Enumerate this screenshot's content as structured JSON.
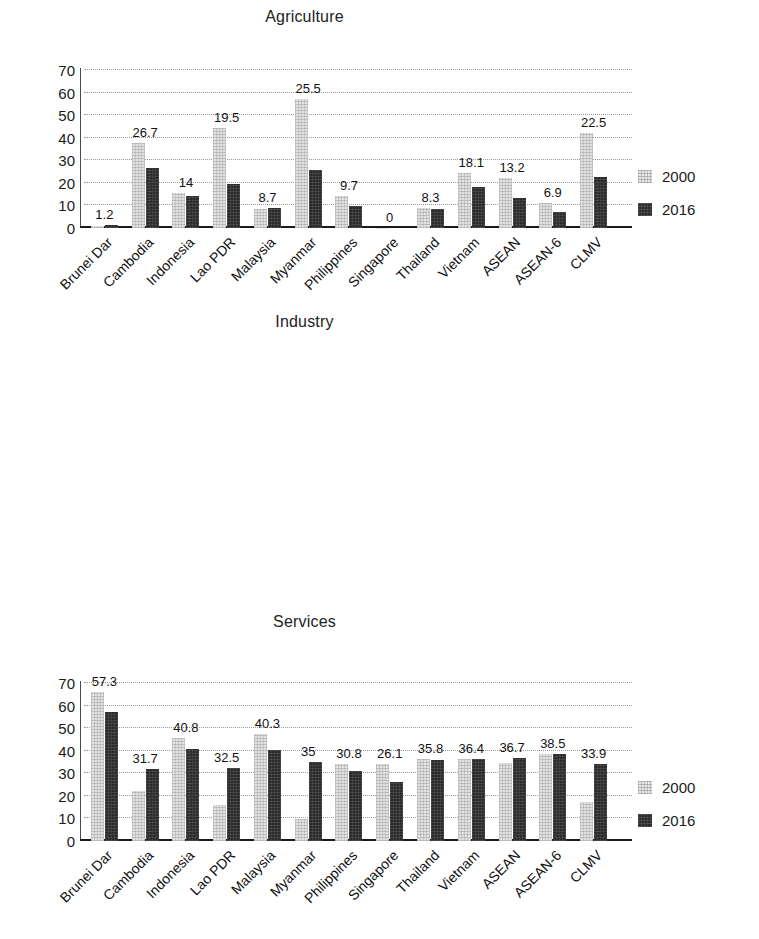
{
  "chart_data": [
    {
      "type": "bar",
      "title": "Agriculture",
      "xlabel": "",
      "ylabel": "",
      "ylim": [
        0,
        70
      ],
      "yticks": [
        0,
        10,
        20,
        30,
        40,
        50,
        60,
        70
      ],
      "grid": true,
      "legend_position": "right",
      "categories": [
        "Brunei Dar",
        "Cambodia",
        "Indonesia",
        "Lao PDR",
        "Malaysia",
        "Myanmar",
        "Philippines",
        "Singapore",
        "Thailand",
        "Vietnam",
        "ASEAN",
        "ASEAN-6",
        "CLMV"
      ],
      "series": [
        {
          "name": "2000",
          "values": [
            0.9,
            37.8,
            15.6,
            44.5,
            8.6,
            57.2,
            14.0,
            0.1,
            9.0,
            24.5,
            22.0,
            11.3,
            42.0
          ]
        },
        {
          "name": "2016",
          "values": [
            1.2,
            26.7,
            14,
            19.5,
            8.7,
            25.5,
            9.7,
            0,
            8.3,
            18.1,
            13.2,
            6.9,
            22.5
          ]
        }
      ],
      "data_labels": [
        "1.2",
        "26.7",
        "14",
        "19.5",
        "8.7",
        "25.5",
        "9.7",
        "0",
        "8.3",
        "18.1",
        "13.2",
        "6.9",
        "22.5"
      ]
    },
    {
      "type": "bar",
      "title": "Industry",
      "xlabel": "",
      "ylabel": "",
      "ylim": [
        0,
        70
      ],
      "yticks": [
        0,
        10,
        20,
        30,
        40,
        50,
        60,
        70
      ],
      "grid": true,
      "legend_position": "right",
      "categories": [
        "Brunei Dar",
        "Cambodia",
        "Indonesia",
        "Lao PDR",
        "Malaysia",
        "Myanmar",
        "Philippines",
        "Singapore",
        "Thailand",
        "Vietnam",
        "ASEAN",
        "ASEAN-6",
        "CLMV"
      ],
      "series": [
        {
          "name": "2000",
          "values": [
            66.0,
            22.0,
            45.5,
            16.0,
            47.5,
            9.7,
            34.0,
            34.0,
            36.5,
            36.5,
            34.5,
            38.5,
            17.5
          ]
        },
        {
          "name": "2016",
          "values": [
            57.3,
            31.7,
            40.8,
            32.5,
            40.3,
            35,
            30.8,
            26.1,
            35.8,
            36.4,
            36.7,
            38.5,
            33.9
          ]
        }
      ],
      "data_labels": [
        "57.3",
        "31.7",
        "40.8",
        "32.5",
        "40.3",
        "35",
        "30.8",
        "26.1",
        "35.8",
        "36.4",
        "36.7",
        "38.5",
        "33.9"
      ]
    },
    {
      "type": "bar",
      "title": "Services",
      "xlabel": "",
      "ylabel": "",
      "ylim": [
        0,
        80
      ],
      "yticks": [
        0,
        10,
        20,
        30,
        40,
        50,
        60,
        70,
        80
      ],
      "grid": true,
      "legend_position": "right",
      "categories": [
        "Brunei Dar",
        "Cambodia",
        "Indonesia",
        "Lao PDR",
        "Malaysia",
        "Myanmar",
        "Philippines",
        "Singapore",
        "Thailand",
        "Vietnam",
        "ASEAN",
        "ASEAN-6",
        "CLMV"
      ],
      "series": [
        {
          "name": "2000",
          "values": [
            33.5,
            35.0,
            34.0,
            36.5,
            42.0,
            31.5,
            52.0,
            63.0,
            54.0,
            38.0,
            42.5,
            48.5,
            35.0
          ]
        },
        {
          "name": "2016",
          "values": [
            41.3,
            41.6,
            45.3,
            48,
            53,
            39.5,
            59.5,
            73.8,
            55.8,
            45.5,
            50.1,
            54.6,
            43.6
          ]
        }
      ],
      "data_labels": [
        "41.3",
        "41.6",
        "45.3",
        "48",
        "53",
        "39.5",
        "59.5",
        "73.8",
        "55.8",
        "45.5",
        "50.1",
        "54.6",
        "43.6"
      ]
    }
  ],
  "legend": {
    "entries": [
      {
        "label": "2000",
        "color": "#e2e2e2"
      },
      {
        "label": "2016",
        "color": "#2b2b2b"
      }
    ]
  },
  "colors": {
    "series_2000": "#e2e2e2",
    "series_2016": "#2b2b2b",
    "axis": "#1a1a1a",
    "grid": "#9a9a9a",
    "background": "#ffffff"
  }
}
